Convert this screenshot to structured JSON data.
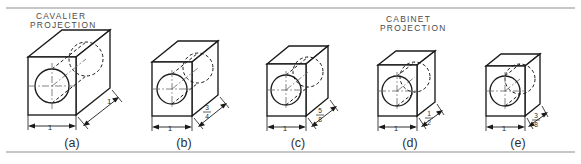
{
  "plate": {
    "width": 581,
    "height": 164,
    "background_color": "#ffffff",
    "line_color": "#1a1a1a",
    "rule_color": "#8e8e8e",
    "center_line_color": "#6d6d6d"
  },
  "annotations": {
    "cavalier": {
      "line1": "CAVALIER",
      "line2": "PROJECTION"
    },
    "cabinet": {
      "line1": "CABINET",
      "line2": "PROJECTION"
    }
  },
  "figures": [
    {
      "id": "a",
      "caption": "(a)",
      "projection": "cavalier",
      "width_label": "1",
      "depth_label": "1",
      "depth_is_fraction": false,
      "depth_numerator": "",
      "depth_denominator": ""
    },
    {
      "id": "b",
      "caption": "(b)",
      "projection": "cavalier",
      "width_label": "1",
      "depth_label": "3/4",
      "depth_is_fraction": true,
      "depth_numerator": "3",
      "depth_denominator": "4"
    },
    {
      "id": "c",
      "caption": "(c)",
      "projection": "cavalier",
      "width_label": "1",
      "depth_label": "5/8",
      "depth_is_fraction": true,
      "depth_numerator": "5",
      "depth_denominator": "8"
    },
    {
      "id": "d",
      "caption": "(d)",
      "projection": "cabinet",
      "width_label": "1",
      "depth_label": "1/2",
      "depth_is_fraction": true,
      "depth_numerator": "1",
      "depth_denominator": "2"
    },
    {
      "id": "e",
      "caption": "(e)",
      "projection": "cabinet",
      "width_label": "1",
      "depth_label": "3/8",
      "depth_is_fraction": true,
      "depth_numerator": "3",
      "depth_denominator": "8"
    }
  ]
}
